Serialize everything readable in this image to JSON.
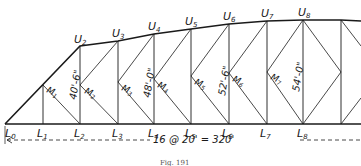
{
  "figure": {
    "caption": "Fig. 191",
    "span_label": "16 @ 20' = 320'",
    "upper_nodes": [
      "U2",
      "U3",
      "U4",
      "U5",
      "U6",
      "U7",
      "U8"
    ],
    "lower_nodes": [
      "L0",
      "L1",
      "L2",
      "L3",
      "L4",
      "L5",
      "L6",
      "L7",
      "L8"
    ],
    "mid_nodes": [
      "M1",
      "M2",
      "M3",
      "M4",
      "M5",
      "M6",
      "M7"
    ],
    "heights": [
      {
        "at": "L2-U2",
        "label": "40'-6\""
      },
      {
        "at": "L4-U4",
        "label": "48'-0\""
      },
      {
        "at": "L6-U6",
        "label": "52'-6\""
      },
      {
        "at": "L8-U8",
        "label": "54'-0\""
      }
    ],
    "labels": {
      "U2": "U",
      "U2s": "2",
      "U3": "U",
      "U3s": "3",
      "U4": "U",
      "U4s": "4",
      "U5": "U",
      "U5s": "5",
      "U6": "U",
      "U6s": "6",
      "U7": "U",
      "U7s": "7",
      "U8": "U",
      "U8s": "8",
      "L0": "L",
      "L0s": "0",
      "L1": "L",
      "L1s": "1",
      "L2": "L",
      "L2s": "2",
      "L3": "L",
      "L3s": "3",
      "L4": "L",
      "L4s": "4",
      "L5": "L",
      "L5s": "5",
      "L6": "L",
      "L6s": "6",
      "L7": "L",
      "L7s": "7",
      "L8": "L",
      "L8s": "8",
      "M1": "M",
      "M1s": "1",
      "M2": "M",
      "M2s": "2",
      "M3": "M",
      "M3s": "3",
      "M4": "M",
      "M4s": "4",
      "M5": "M",
      "M5s": "5",
      "M6": "M",
      "M6s": "6",
      "M7": "M",
      "M7s": "7",
      "h1": "40'-6\"",
      "h2": "48'-0\"",
      "h3": "52'-6\"",
      "h4": "54'-0\""
    }
  }
}
